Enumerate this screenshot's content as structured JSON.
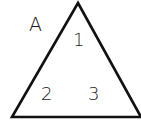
{
  "diagram": {
    "shape": "triangle",
    "stroke_color": "#111111",
    "background": "#ffffff",
    "vertex_label": "A",
    "region_labels": [
      "1",
      "2",
      "3"
    ]
  }
}
